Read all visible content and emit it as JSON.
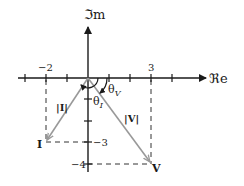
{
  "diagram": {
    "axes": {
      "real_label": "ℜe",
      "imag_label": "ℑm"
    },
    "tick_labels": {
      "x_neg2": "−2",
      "x_3": "3",
      "y_neg3": "−3",
      "y_neg4": "−4"
    },
    "phasors": {
      "current": {
        "label": "I",
        "magnitude_label": "|I|",
        "re": -2,
        "im": -3,
        "angle_label": "θ",
        "angle_sub": "I"
      },
      "voltage": {
        "label": "V",
        "magnitude_label": "|V|",
        "re": 3,
        "im": -4,
        "angle_label": "θ",
        "angle_sub": "V"
      }
    },
    "colors": {
      "axis": "#1a1a1a",
      "phasor": "#999999",
      "dashed": "#333333"
    }
  }
}
